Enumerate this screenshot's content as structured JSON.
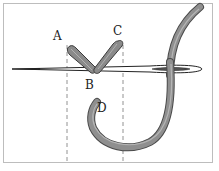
{
  "diagram": {
    "labels": {
      "a": "A",
      "b": "B",
      "c": "C",
      "d": "D"
    },
    "colors": {
      "thread": "#8a8a8a",
      "thread_dark": "#4a4a4a",
      "needle": "#ffffff",
      "needle_outline": "#222222",
      "guide_line": "#777777",
      "frame_border": "#bdbdbd"
    }
  }
}
